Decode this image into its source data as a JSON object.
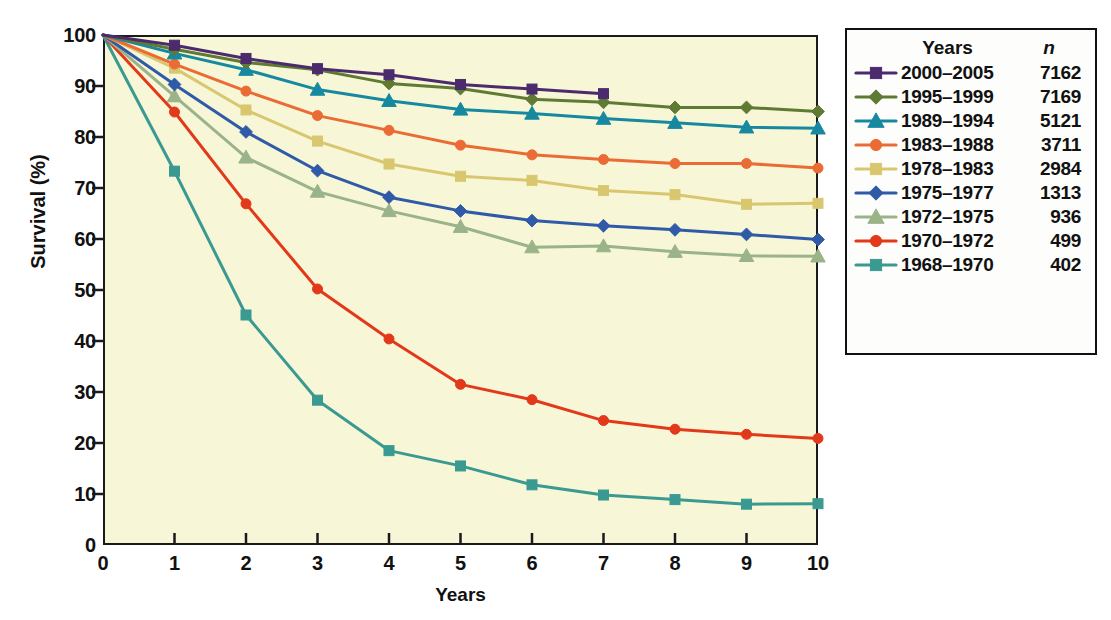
{
  "chart_data": {
    "type": "line",
    "title": "",
    "xlabel": "Years",
    "ylabel": "Survival (%)",
    "xlim": [
      0,
      10
    ],
    "ylim": [
      0,
      100
    ],
    "xticks": [
      "0",
      "1",
      "2",
      "3",
      "4",
      "5",
      "6",
      "7",
      "8",
      "9",
      "10"
    ],
    "yticks": [
      "0",
      "10",
      "20",
      "30",
      "40",
      "50",
      "60",
      "70",
      "80",
      "90",
      "100"
    ],
    "grid": false,
    "legend_position": "right",
    "plot_background": "#f7f6d6",
    "legend_headers": {
      "series": "Years",
      "count": "n"
    },
    "x": [
      0,
      1,
      2,
      3,
      4,
      5,
      6,
      7,
      8,
      9,
      10
    ],
    "series": [
      {
        "name": "2000–2005",
        "n": "7162",
        "color": "#4b2b6e",
        "marker": "square",
        "x": [
          0,
          1,
          2,
          3,
          4,
          5,
          6,
          7
        ],
        "values": [
          100,
          98.0,
          95.4,
          93.4,
          92.2,
          90.3,
          89.4,
          88.5
        ]
      },
      {
        "name": "1995–1999",
        "n": "7169",
        "color": "#5e7a33",
        "marker": "diamond",
        "x": [
          0,
          1,
          2,
          3,
          4,
          5,
          6,
          7,
          8,
          9,
          10
        ],
        "values": [
          100,
          97.2,
          94.6,
          93.2,
          90.5,
          89.5,
          87.4,
          86.8,
          85.8,
          85.8,
          85.0
        ]
      },
      {
        "name": "1989–1994",
        "n": "5121",
        "color": "#1689a0",
        "marker": "triangle",
        "x": [
          0,
          1,
          2,
          3,
          4,
          5,
          6,
          7,
          8,
          9,
          10
        ],
        "values": [
          100,
          96.4,
          93.2,
          89.3,
          87.1,
          85.4,
          84.6,
          83.6,
          82.8,
          81.9,
          81.7
        ]
      },
      {
        "name": "1983–1988",
        "n": "3711",
        "color": "#ea6c34",
        "marker": "circle",
        "x": [
          0,
          1,
          2,
          3,
          4,
          5,
          6,
          7,
          8,
          9,
          10
        ],
        "values": [
          100,
          94.3,
          89.0,
          84.2,
          81.3,
          78.4,
          76.5,
          75.6,
          74.8,
          74.8,
          73.9
        ]
      },
      {
        "name": "1978–1983",
        "n": "2984",
        "color": "#d9c770",
        "marker": "square",
        "x": [
          0,
          1,
          2,
          3,
          4,
          5,
          6,
          7,
          8,
          9,
          10
        ],
        "values": [
          100,
          93.5,
          85.3,
          79.2,
          74.7,
          72.3,
          71.5,
          69.5,
          68.7,
          66.8,
          67.0
        ]
      },
      {
        "name": "1975–1977",
        "n": "1313",
        "color": "#2f5aa8",
        "marker": "diamond",
        "x": [
          0,
          1,
          2,
          3,
          4,
          5,
          6,
          7,
          8,
          9,
          10
        ],
        "values": [
          100,
          90.3,
          81.0,
          73.4,
          68.2,
          65.5,
          63.6,
          62.6,
          61.8,
          60.9,
          59.9
        ]
      },
      {
        "name": "1972–1975",
        "n": "936",
        "color": "#9bb388",
        "marker": "triangle",
        "x": [
          0,
          1,
          2,
          3,
          4,
          5,
          6,
          7,
          8,
          9,
          10
        ],
        "values": [
          100,
          88.0,
          76.0,
          69.3,
          65.5,
          62.4,
          58.4,
          58.6,
          57.5,
          56.7,
          56.6
        ]
      },
      {
        "name": "1970–1972",
        "n": "499",
        "color": "#e2391a",
        "marker": "circle",
        "x": [
          0,
          1,
          2,
          3,
          4,
          5,
          6,
          7,
          8,
          9,
          10
        ],
        "values": [
          100,
          84.9,
          66.9,
          50.2,
          40.4,
          31.5,
          28.5,
          24.4,
          22.7,
          21.7,
          20.9
        ]
      },
      {
        "name": "1968–1970",
        "n": "402",
        "color": "#3a9a92",
        "marker": "square",
        "x": [
          0,
          1,
          2,
          3,
          4,
          5,
          6,
          7,
          8,
          9,
          10
        ],
        "values": [
          100,
          73.3,
          45.1,
          28.4,
          18.5,
          15.5,
          11.8,
          9.8,
          8.9,
          8.0,
          8.1
        ]
      }
    ]
  }
}
